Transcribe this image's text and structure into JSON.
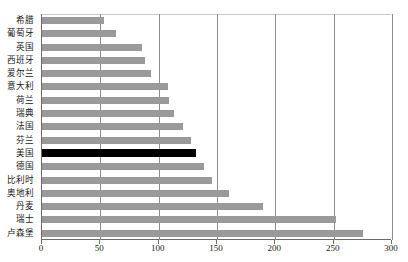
{
  "chart_data": {
    "type": "bar",
    "orientation": "horizontal",
    "title": "",
    "xlabel": "",
    "ylabel": "",
    "xlim": [
      0,
      300
    ],
    "xticks": [
      0,
      50,
      100,
      150,
      200,
      250,
      300
    ],
    "grid": true,
    "legend": "none",
    "categories": [
      "希腊",
      "葡萄牙",
      "英国",
      "西班牙",
      "爱尔兰",
      "意大利",
      "荷兰",
      "瑞典",
      "法国",
      "芬兰",
      "美国",
      "德国",
      "比利时",
      "奥地利",
      "丹麦",
      "瑞士",
      "卢森堡"
    ],
    "values": [
      53,
      63,
      86,
      88,
      93,
      108,
      109,
      113,
      121,
      128,
      132,
      139,
      146,
      160,
      189,
      252,
      275
    ],
    "highlight_category": "美国",
    "colors": {
      "bar": "#9a9a9a",
      "bar_highlight": "#000000",
      "gridline": "#8d8d8d",
      "axis": "#6b6b6b",
      "text": "#1b1b1b"
    }
  }
}
